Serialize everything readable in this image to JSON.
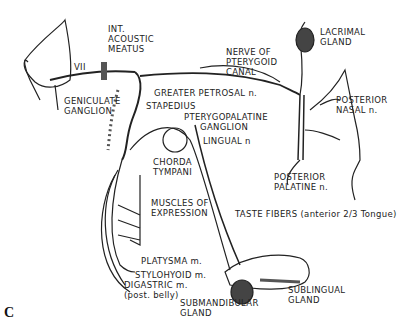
{
  "figure": {
    "panel_letter": "C",
    "labels": {
      "int_acoustic_meatus": [
        "INT.",
        "ACOUSTIC",
        "MEATUS"
      ],
      "nerve_vii": "VII",
      "geniculate_ganglion": [
        "GENICULATE",
        "GANGLION"
      ],
      "greater_petrosal": "GREATER PETROSAL n.",
      "stapedius": "STAPEDIUS",
      "pterygopalatine_ganglion": [
        "PTERYGOPALATINE",
        "GANGLION"
      ],
      "nerve_of_pterygoid_canal": [
        "NERVE OF",
        "PTERYGOID",
        "CANAL"
      ],
      "lacrimal_gland": [
        "LACRIMAL",
        "GLAND"
      ],
      "posterior_nasal": [
        "POSTERIOR",
        "NASAL n."
      ],
      "posterior_palatine": [
        "POSTERIOR",
        "PALATINE n."
      ],
      "lingual": "LINGUAL n",
      "chorda_tympani": [
        "CHORDA",
        "TYMPANI"
      ],
      "muscles_of_expression": [
        "MUSCLES OF",
        "EXPRESSION"
      ],
      "taste_fibers": "TASTE FIBERS (anterior 2/3 Tongue)",
      "platysma": "PLATYSMA m.",
      "stylohyoid": "STYLOHYOID m.",
      "digastric": [
        "DIGASTRIC m.",
        "(post. belly)"
      ],
      "submandibular_gland": [
        "SUBMANDIBULAR",
        "GLAND"
      ],
      "sublingual_gland": [
        "SUBLINGUAL",
        "GLAND"
      ]
    },
    "colors": {
      "ink": "#222222",
      "background": "#ffffff"
    }
  }
}
